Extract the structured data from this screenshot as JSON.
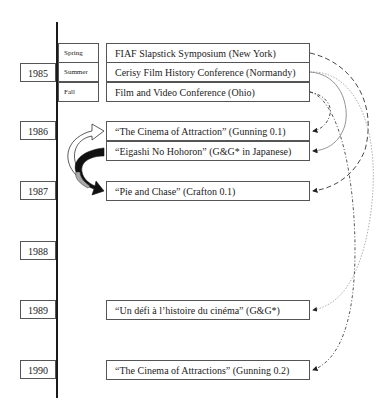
{
  "timeline": {
    "years": [
      {
        "label": "1985",
        "top": 63
      },
      {
        "label": "1986",
        "top": 121
      },
      {
        "label": "1987",
        "top": 181
      },
      {
        "label": "1988",
        "top": 241
      },
      {
        "label": "1989",
        "top": 300
      },
      {
        "label": "1990",
        "top": 360
      }
    ],
    "seasons_1985": [
      {
        "label": "Spring",
        "top": 43
      },
      {
        "label": "Summer",
        "top": 62
      },
      {
        "label": "Fall",
        "top": 82
      }
    ]
  },
  "events": [
    {
      "id": "fiaf",
      "label": "FIAF Slapstick Symposium (New York)",
      "top": 43
    },
    {
      "id": "cerisy",
      "label": "Cerisy Film History Conference (Normandy)",
      "top": 62
    },
    {
      "id": "ohio",
      "label": "Film and Video Conference (Ohio)",
      "top": 82
    },
    {
      "id": "gunning01",
      "label": "“The Cinema of Attraction” (Gunning 0.1)",
      "top": 121
    },
    {
      "id": "eigashi",
      "label": "“Eigashi No Hohoron” (G&G* in Japanese)",
      "top": 141
    },
    {
      "id": "crafton",
      "label": "“Pie and Chase” (Crafton 0.1)",
      "top": 181
    },
    {
      "id": "undefi",
      "label": "“Un défi à l’histoire du cinéma” (G&G*)",
      "top": 300
    },
    {
      "id": "gunning02",
      "label": "“The Cinema of Attractions” (Gunning 0.2)",
      "top": 360
    }
  ],
  "connectors": [
    {
      "from": "fiaf",
      "to": "crafton",
      "style": "dashed"
    },
    {
      "from": "cerisy",
      "to": "eigashi",
      "style": "solid-gray"
    },
    {
      "from": "cerisy",
      "to": "undefi",
      "style": "dotted-gray"
    },
    {
      "from": "ohio",
      "to": "gunning01",
      "style": "dash-dot"
    },
    {
      "from": "ohio",
      "to": "gunning02",
      "style": "dash-dot"
    }
  ],
  "curved_arrows": [
    {
      "name": "white-arrow",
      "to": "gunning01"
    },
    {
      "name": "black-arrow",
      "from": "eigashi",
      "to": "crafton"
    }
  ]
}
